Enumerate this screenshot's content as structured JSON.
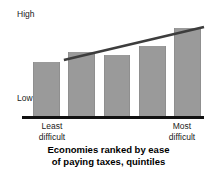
{
  "chart_data": {
    "type": "bar",
    "title": "Economies ranked by ease of paying taxes, quintiles",
    "title_line1": "Economies ranked by ease",
    "title_line2": "of paying taxes, quintiles",
    "xlabel": "Economies ranked by ease of paying taxes, quintiles",
    "ylabel": "",
    "categories": [
      "1",
      "2",
      "3",
      "4",
      "5"
    ],
    "values": [
      56,
      66,
      63,
      72,
      90
    ],
    "ylim": [
      0,
      100
    ],
    "y_tick_labels": [
      "Low",
      "High"
    ],
    "x_tick_labels": [
      "Least difficult",
      "Most difficult"
    ],
    "grid": false,
    "legend": false,
    "series": [
      {
        "name": "quintile value",
        "type": "bar",
        "values": [
          56,
          66,
          63,
          72,
          90
        ],
        "color": "#9a9a9a"
      },
      {
        "name": "trend",
        "type": "line",
        "x": [
          0.52,
          4.5
        ],
        "values": [
          58,
          91
        ],
        "color": "#3d3d3d"
      }
    ]
  },
  "axis": {
    "y_high_label": "High",
    "y_low_label": "Low",
    "x_left_label_line1": "Least",
    "x_left_label_line2": "difficult",
    "x_right_label_line1": "Most",
    "x_right_label_line2": "difficult"
  },
  "caption": {
    "line1": "Economies ranked by ease",
    "line2": "of paying taxes, quintiles"
  },
  "colors": {
    "bar": "#9a9a9a",
    "trendline": "#3d3d3d",
    "axis": "#111111",
    "text": "#1a1a1a",
    "background": "#ffffff"
  }
}
